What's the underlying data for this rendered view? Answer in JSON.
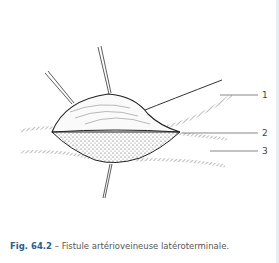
{
  "figure": {
    "labels": [
      "1",
      "2",
      "3"
    ]
  },
  "caption": {
    "number": "Fig. 64.2",
    "separator": " – ",
    "text": "Fistule artérioveineuse latéroterminale."
  },
  "colors": {
    "caption_number": "#2b5d8e",
    "caption_text": "#555555",
    "ink": "#333333"
  }
}
